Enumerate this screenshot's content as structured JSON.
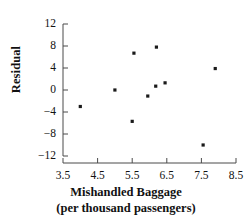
{
  "chart_data": {
    "type": "scatter",
    "title": "",
    "xlabel": "Mishandled Baggage",
    "xlabel_line2": "(per thousand passengers)",
    "ylabel": "Residual",
    "xlim": [
      3.5,
      8.5
    ],
    "ylim": [
      -12,
      12
    ],
    "xticks": [
      3.5,
      4.5,
      5.5,
      6.5,
      7.5,
      8.5
    ],
    "xtick_labels": [
      "3.5",
      "4.5",
      "5.5",
      "6.5",
      "7.5",
      "8.5"
    ],
    "yticks": [
      12,
      8,
      4,
      0,
      -4,
      -8,
      -12
    ],
    "ytick_labels": [
      "12",
      "8",
      "4",
      "0",
      "−4",
      "−8",
      "−12"
    ],
    "grid": false,
    "legend": null,
    "marker": "square",
    "marker_color": "#1a1a1a",
    "points": [
      {
        "x": 4.0,
        "y": -3.0
      },
      {
        "x": 5.0,
        "y": 0.0
      },
      {
        "x": 5.55,
        "y": 6.7
      },
      {
        "x": 5.5,
        "y": -5.7
      },
      {
        "x": 5.95,
        "y": -1.1
      },
      {
        "x": 6.2,
        "y": 7.8
      },
      {
        "x": 6.18,
        "y": 0.7
      },
      {
        "x": 6.45,
        "y": 1.3
      },
      {
        "x": 7.55,
        "y": -10.0
      },
      {
        "x": 7.9,
        "y": 3.9
      }
    ]
  },
  "axis_color": "#4a4a4a"
}
